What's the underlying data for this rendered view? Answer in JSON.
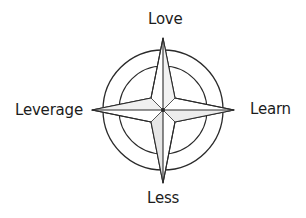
{
  "diagram": {
    "type": "compass-rose",
    "directions": {
      "north": "Love",
      "east": "Learn",
      "south": "Less",
      "west": "Leverage"
    },
    "colors": {
      "stroke": "#2a2a2a",
      "fill": "#ffffff",
      "shade": "#9a9a9a"
    }
  }
}
